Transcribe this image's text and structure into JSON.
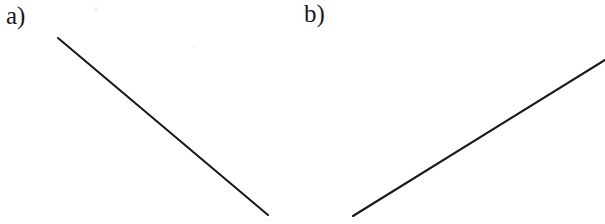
{
  "figure": {
    "width": 605,
    "height": 224,
    "background_color": "#ffffff",
    "stroke_color": "#1a1a1a",
    "stroke_width": 2.1,
    "panels": [
      {
        "label": "a)",
        "name": "panel-a",
        "line": {
          "x1": 58,
          "y1": 38,
          "x2": 268,
          "y2": 215,
          "direction": "descending",
          "slope": 0.843,
          "angle_degrees": 40.1
        }
      },
      {
        "label": "b)",
        "name": "panel-b",
        "line": {
          "x1": 51,
          "y1": 216,
          "x2": 303,
          "y2": 60,
          "direction": "ascending",
          "slope": -0.619,
          "angle_degrees": -31.8
        }
      }
    ]
  },
  "chart_data": {
    "type": "line",
    "title": "",
    "xlabel": "",
    "ylabel": "",
    "grid": false,
    "legend": "none",
    "xlim": [
      0,
      605
    ],
    "ylim": [
      224,
      0
    ],
    "series": [
      {
        "name": "a)",
        "x": [
          58,
          268
        ],
        "y": [
          38,
          215
        ]
      },
      {
        "name": "b)",
        "x": [
          353,
          605
        ],
        "y": [
          216,
          60
        ]
      }
    ],
    "annotations": [
      "a)",
      "b)"
    ]
  }
}
